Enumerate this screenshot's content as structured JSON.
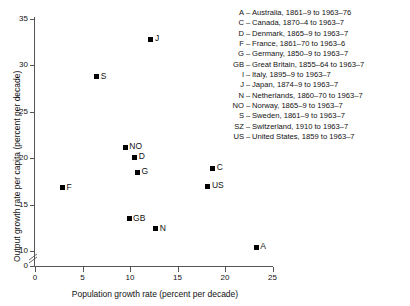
{
  "chart_data": {
    "type": "scatter",
    "title": "",
    "xlabel": "Population growth rate (percent per decade)",
    "ylabel": "Output growth rate per capita (percent per decade)",
    "xlim": [
      0,
      25
    ],
    "ylim": [
      10,
      35
    ],
    "y_axis_break": true,
    "y_break_from": 0,
    "y_break_to": 10,
    "grid": false,
    "xticks": [
      0,
      5,
      10,
      15,
      20,
      25
    ],
    "yticks": [
      0,
      10,
      15,
      20,
      25,
      30,
      35
    ],
    "xticklabels": [
      "0",
      "5",
      "10",
      "15",
      "20",
      "25"
    ],
    "yticklabels": [
      "0",
      "10",
      "15",
      "20",
      "25",
      "30",
      "35"
    ],
    "marker": "filled-square",
    "marker_color": "#000000",
    "points": [
      {
        "label": "J",
        "x": 12.2,
        "y": 32.8
      },
      {
        "label": "S",
        "x": 6.5,
        "y": 28.8
      },
      {
        "label": "NO",
        "x": 9.5,
        "y": 21.2
      },
      {
        "label": "D",
        "x": 10.5,
        "y": 20.1
      },
      {
        "label": "G",
        "x": 10.8,
        "y": 18.5
      },
      {
        "label": "C",
        "x": 18.7,
        "y": 18.9
      },
      {
        "label": "US",
        "x": 18.2,
        "y": 17.0
      },
      {
        "label": "F",
        "x": 2.9,
        "y": 16.8
      },
      {
        "label": "GB",
        "x": 9.9,
        "y": 13.5
      },
      {
        "label": "N",
        "x": 12.7,
        "y": 12.4
      },
      {
        "label": "A",
        "x": 23.3,
        "y": 10.4
      }
    ],
    "legend_position": "top-right",
    "legend": [
      {
        "key": "A",
        "dash": "–",
        "text": "Australia, 1861–9 to 1963–76"
      },
      {
        "key": "C",
        "dash": "–",
        "text": "Canada, 1870–4 to 1963–7"
      },
      {
        "key": "D",
        "dash": "–",
        "text": "Denmark, 1865–9 to 1963–7"
      },
      {
        "key": "F",
        "dash": "–",
        "text": "France, 1861–70 to 1963–6"
      },
      {
        "key": "G",
        "dash": "–",
        "text": "Germany, 1850–9 to 1963–7"
      },
      {
        "key": "GB",
        "dash": "–",
        "text": "Great Britain, 1855–64 to 1963–7"
      },
      {
        "key": "I",
        "dash": "–",
        "text": "Italy, 1895–9 to 1963–7"
      },
      {
        "key": "J",
        "dash": "–",
        "text": "Japan, 1874–9 to 1963–7"
      },
      {
        "key": "N",
        "dash": "–",
        "text": "Netherlands, 1860–70 to 1963–7"
      },
      {
        "key": "NO",
        "dash": "–",
        "text": "Norway, 1865–9 to 1963–7"
      },
      {
        "key": "S",
        "dash": "–",
        "text": "Sweden, 1861–9 to 1963–7"
      },
      {
        "key": "SZ",
        "dash": "–",
        "text": "Switzerland, 1910 to 1963–7"
      },
      {
        "key": "US",
        "dash": "–",
        "text": "United States, 1859 to 1963–7"
      }
    ]
  }
}
